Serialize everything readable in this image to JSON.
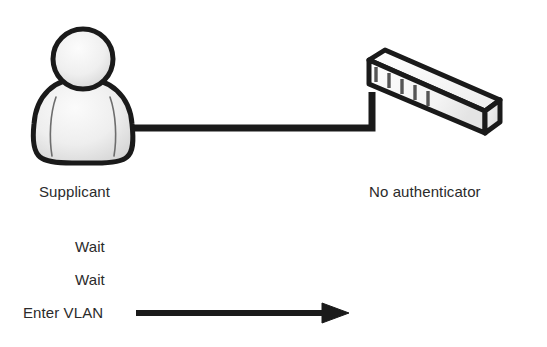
{
  "diagram": {
    "type": "network-authentication-sequence",
    "background_color": "#ffffff",
    "stroke_color": "#1a1a1a",
    "text_color": "#2b2b2b",
    "nodes": [
      {
        "id": "supplicant",
        "icon": "person-icon",
        "label": "Supplicant",
        "fill_light": "#f2f2f2",
        "fill_dark": "#c9c9c9"
      },
      {
        "id": "authenticator",
        "icon": "network-switch-icon",
        "label": "No authenticator",
        "ports": 5,
        "fill_light": "#ffffff",
        "fill_dark": "#e0e0e0"
      }
    ],
    "link": {
      "name": "supplicant-to-switch-link",
      "style": "elbow"
    },
    "sequence": [
      {
        "label": "Wait",
        "has_arrow": false
      },
      {
        "label": "Wait",
        "has_arrow": false
      },
      {
        "label": "Enter VLAN",
        "has_arrow": true,
        "arrow_direction": "right"
      }
    ]
  }
}
